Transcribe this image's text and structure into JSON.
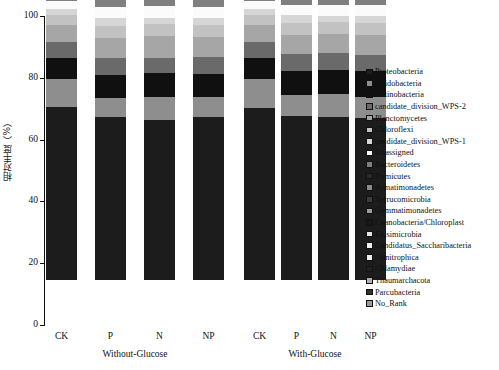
{
  "chart_data": {
    "type": "bar",
    "stacked": true,
    "title": "",
    "xlabel": "",
    "ylabel": "相对丰度（%）",
    "ylim": [
      0,
      100
    ],
    "yticks": [
      0,
      20,
      40,
      60,
      80,
      100
    ],
    "grid": false,
    "legend_position": "right",
    "categories": [
      "CK",
      "P",
      "N",
      "NP",
      "CK",
      "P",
      "N",
      "NP"
    ],
    "groups": [
      {
        "label": "Without-Glucose",
        "categories": [
          "CK",
          "P",
          "N",
          "NP"
        ]
      },
      {
        "label": "With-Glucose",
        "categories": [
          "CK",
          "P",
          "N",
          "NP"
        ]
      }
    ],
    "series": [
      {
        "name": "Proteobacteria",
        "color": "#1c1c1c",
        "values": [
          56.5,
          53.0,
          52.0,
          53.5,
          56.0,
          54.5,
          54.0,
          53.5
        ]
      },
      {
        "name": "Acidobacteria",
        "color": "#8e8e8e",
        "values": [
          9.0,
          6.0,
          7.5,
          6.5,
          9.5,
          7.0,
          7.5,
          7.0
        ]
      },
      {
        "name": "Actinobacteria",
        "color": "#101010",
        "values": [
          7.0,
          7.5,
          8.0,
          7.5,
          7.0,
          8.0,
          8.0,
          8.5
        ]
      },
      {
        "name": "candidate_division_WPS-2",
        "color": "#6a6a6a",
        "values": [
          5.0,
          5.5,
          5.0,
          5.5,
          5.0,
          5.5,
          5.5,
          5.5
        ]
      },
      {
        "name": "Planctomycetes",
        "color": "#a6a6a6",
        "values": [
          5.5,
          6.5,
          7.0,
          6.5,
          5.5,
          6.5,
          6.5,
          6.5
        ]
      },
      {
        "name": "Chloroflexi",
        "color": "#c2c2c2",
        "values": [
          3.5,
          4.0,
          4.0,
          4.0,
          3.5,
          4.0,
          4.0,
          4.0
        ]
      },
      {
        "name": "candidate_division_WPS-1",
        "color": "#d6d6d6",
        "values": [
          2.0,
          2.5,
          2.0,
          2.5,
          2.0,
          2.5,
          2.0,
          2.5
        ]
      },
      {
        "name": "Unassigned",
        "color": "#fbfbfb",
        "values": [
          2.5,
          3.5,
          4.0,
          3.5,
          2.5,
          3.5,
          3.5,
          3.5
        ]
      },
      {
        "name": "Bacteroidetes",
        "color": "#7f7f7f",
        "values": [
          4.0,
          6.0,
          5.5,
          6.0,
          4.0,
          5.5,
          5.5,
          5.5
        ]
      },
      {
        "name": "Firmicutes",
        "color": "#2a2a2a",
        "values": [
          1.3,
          1.3,
          1.3,
          1.3,
          1.3,
          1.3,
          1.3,
          1.3
        ]
      },
      {
        "name": "Armatimonadetes",
        "color": "#8a8a8a",
        "values": [
          0.8,
          0.8,
          0.8,
          0.8,
          0.8,
          0.8,
          0.8,
          0.8
        ]
      },
      {
        "name": "Verrucomicrobia",
        "color": "#3c3c3c",
        "values": [
          0.7,
          0.7,
          0.7,
          0.7,
          0.7,
          0.7,
          0.7,
          0.7
        ]
      },
      {
        "name": "Gemmatimonadetes",
        "color": "#9c9c9c",
        "values": [
          0.6,
          0.6,
          0.6,
          0.6,
          0.6,
          0.6,
          0.6,
          0.6
        ]
      },
      {
        "name": "Cyanobacteria/Chloroplast",
        "color": "#181818",
        "values": [
          0.5,
          0.5,
          0.5,
          0.5,
          0.5,
          0.5,
          0.5,
          0.5
        ]
      },
      {
        "name": "Elusimicrobia",
        "color": "#e6e6e6",
        "values": [
          0.4,
          0.4,
          0.4,
          0.4,
          0.4,
          0.4,
          0.4,
          0.4
        ]
      },
      {
        "name": "Candidatus_Saccharibacteria",
        "color": "#f0f0f0",
        "values": [
          0.3,
          0.3,
          0.3,
          0.3,
          0.3,
          0.3,
          0.3,
          0.3
        ]
      },
      {
        "name": "Ohnitrophica",
        "color": "#ededed",
        "values": [
          0.2,
          0.2,
          0.2,
          0.2,
          0.2,
          0.2,
          0.2,
          0.2
        ]
      },
      {
        "name": "Cblamydiae",
        "color": "#222222",
        "values": [
          0.2,
          0.2,
          0.2,
          0.2,
          0.2,
          0.2,
          0.2,
          0.2
        ]
      },
      {
        "name": "Thaumarchacota",
        "color": "#b0b0b0",
        "values": [
          0.2,
          0.2,
          0.2,
          0.2,
          0.2,
          0.2,
          0.2,
          0.2
        ]
      },
      {
        "name": "Parcubacteria",
        "color": "#303030",
        "values": [
          0.2,
          0.2,
          0.2,
          0.2,
          0.2,
          0.2,
          0.2,
          0.2
        ]
      },
      {
        "name": "No_Rank",
        "color": "#9a9a9a",
        "values": [
          0.4,
          0.4,
          0.4,
          0.4,
          0.4,
          0.4,
          0.4,
          0.4
        ]
      }
    ]
  },
  "legend": {
    "items": [
      "Proteobacteria",
      "Acidobacteria",
      "Actinobacteria",
      "candidate_division_WPS-2",
      "Planctomycetes",
      "Chloroflexi",
      "candidate_division_WPS-1",
      "Unassigned",
      "Bacteroidetes",
      "Firmicutes",
      "Armatimonadetes",
      "Verrucomicrobia",
      "Gemmatimonadetes",
      "Cyanobacteria/Chloroplast",
      "Elusimicrobia",
      "Candidatus_Saccharibacteria",
      "Ohnitrophica",
      "Cblamydiae",
      "Thaumarchacota",
      "Parcubacteria",
      "No_Rank"
    ]
  }
}
